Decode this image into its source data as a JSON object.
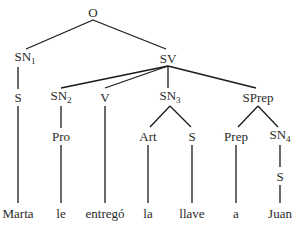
{
  "diagram": {
    "type": "syntax-tree",
    "nodes": [
      {
        "id": "O",
        "label": "O",
        "sub": "",
        "x": 93,
        "y": 12
      },
      {
        "id": "SN1",
        "label": "SN",
        "sub": "1",
        "x": 25,
        "y": 58
      },
      {
        "id": "SV",
        "label": "SV",
        "sub": "",
        "x": 168,
        "y": 58
      },
      {
        "id": "S1",
        "label": "S",
        "sub": "",
        "x": 18,
        "y": 97
      },
      {
        "id": "SN2",
        "label": "SN",
        "sub": "2",
        "x": 61,
        "y": 97
      },
      {
        "id": "V",
        "label": "V",
        "sub": "",
        "x": 105,
        "y": 97
      },
      {
        "id": "SN3",
        "label": "SN",
        "sub": "3",
        "x": 170,
        "y": 97
      },
      {
        "id": "SPrep",
        "label": "SPrep",
        "sub": "",
        "x": 258,
        "y": 97
      },
      {
        "id": "Pro",
        "label": "Pro",
        "sub": "",
        "x": 61,
        "y": 136
      },
      {
        "id": "Art",
        "label": "Art",
        "sub": "",
        "x": 148,
        "y": 136
      },
      {
        "id": "S2",
        "label": "S",
        "sub": "",
        "x": 192,
        "y": 136
      },
      {
        "id": "Prep",
        "label": "Prep",
        "sub": "",
        "x": 236,
        "y": 136
      },
      {
        "id": "SN4",
        "label": "SN",
        "sub": "4",
        "x": 280,
        "y": 136
      },
      {
        "id": "S3",
        "label": "S",
        "sub": "",
        "x": 280,
        "y": 176
      },
      {
        "id": "w1",
        "label": "Marta",
        "sub": "",
        "x": 18,
        "y": 213
      },
      {
        "id": "w2",
        "label": "le",
        "sub": "",
        "x": 61,
        "y": 213
      },
      {
        "id": "w3",
        "label": "entregó",
        "sub": "",
        "x": 105,
        "y": 213
      },
      {
        "id": "w4",
        "label": "la",
        "sub": "",
        "x": 148,
        "y": 213
      },
      {
        "id": "w5",
        "label": "llave",
        "sub": "",
        "x": 192,
        "y": 213
      },
      {
        "id": "w6",
        "label": "a",
        "sub": "",
        "x": 236,
        "y": 213
      },
      {
        "id": "w7",
        "label": "Juan",
        "sub": "",
        "x": 280,
        "y": 213
      }
    ],
    "edges": [
      {
        "from": [
          93,
          20
        ],
        "to": [
          26,
          49
        ]
      },
      {
        "from": [
          93,
          20
        ],
        "to": [
          166,
          49
        ]
      },
      {
        "from": [
          18,
          67
        ],
        "to": [
          18,
          89
        ]
      },
      {
        "from": [
          168,
          66
        ],
        "to": [
          61,
          88
        ]
      },
      {
        "from": [
          168,
          66
        ],
        "to": [
          105,
          88
        ]
      },
      {
        "from": [
          168,
          66
        ],
        "to": [
          168,
          88
        ]
      },
      {
        "from": [
          168,
          66
        ],
        "to": [
          256,
          88
        ]
      },
      {
        "from": [
          18,
          106
        ],
        "to": [
          18,
          203
        ]
      },
      {
        "from": [
          61,
          106
        ],
        "to": [
          61,
          128
        ]
      },
      {
        "from": [
          105,
          106
        ],
        "to": [
          105,
          203
        ]
      },
      {
        "from": [
          170,
          106
        ],
        "to": [
          150,
          127
        ]
      },
      {
        "from": [
          170,
          106
        ],
        "to": [
          191,
          127
        ]
      },
      {
        "from": [
          258,
          106
        ],
        "to": [
          238,
          127
        ]
      },
      {
        "from": [
          258,
          106
        ],
        "to": [
          278,
          127
        ]
      },
      {
        "from": [
          61,
          145
        ],
        "to": [
          61,
          203
        ]
      },
      {
        "from": [
          148,
          145
        ],
        "to": [
          148,
          203
        ]
      },
      {
        "from": [
          192,
          145
        ],
        "to": [
          192,
          203
        ]
      },
      {
        "from": [
          236,
          145
        ],
        "to": [
          236,
          203
        ]
      },
      {
        "from": [
          280,
          145
        ],
        "to": [
          280,
          167
        ]
      },
      {
        "from": [
          280,
          185
        ],
        "to": [
          280,
          203
        ]
      }
    ]
  }
}
